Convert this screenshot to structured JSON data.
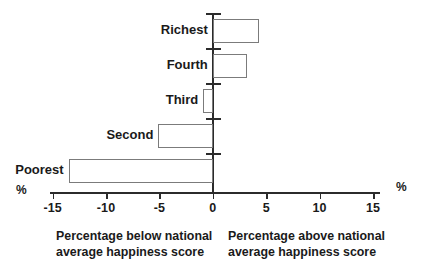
{
  "chart_data": {
    "type": "bar",
    "orientation": "horizontal",
    "title": "",
    "subtitle": "",
    "xlabel": "%",
    "ylabel": "",
    "categories": [
      "Poorest",
      "Second",
      "Third",
      "Fourth",
      "Richest"
    ],
    "values": [
      -13.5,
      -5.1,
      -0.9,
      3.2,
      4.3
    ],
    "series": [
      {
        "name": "Percentage difference from national average happiness score",
        "values": [
          -13.5,
          -5.1,
          -0.9,
          3.2,
          4.3
        ]
      }
    ],
    "xlim": [
      -15,
      15
    ],
    "xticks": [
      -15,
      -10,
      -5,
      0,
      5,
      15
    ],
    "xtick_labels": [
      "-15",
      "-10",
      "-5",
      "0",
      "5",
      "10",
      "15"
    ],
    "xtick_values": [
      -15,
      -10,
      -5,
      0,
      5,
      10,
      15
    ],
    "grid": false,
    "legend": "none",
    "bar_fill": "#ffffff",
    "bar_stroke": "#7b7b7b",
    "axis_color": "#2b2b2b"
  },
  "axis": {
    "unit_left": "%",
    "unit_right": "%"
  },
  "captions": {
    "left": "Percentage below national\naverage happiness score",
    "right": "Percentage above national\naverage happiness score"
  }
}
